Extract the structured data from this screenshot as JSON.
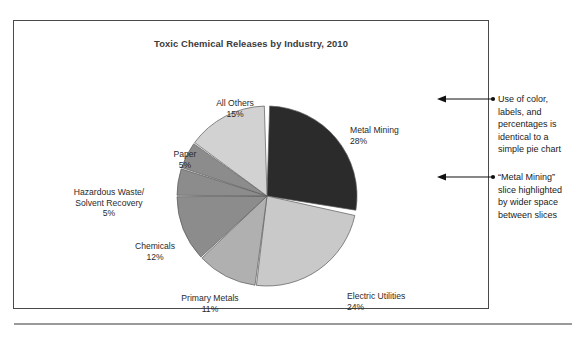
{
  "chart_data": {
    "type": "pie",
    "title": "Toxic Chemical Releases by Industry, 2010",
    "xlabel": "",
    "ylabel": "",
    "legend_position": "none",
    "grid": false,
    "categories": [
      "Metal Mining",
      "Electric Utilities",
      "Primary Metals",
      "Chemicals",
      "Hazardous Waste/ Solvent Recovery",
      "Paper",
      "All Others"
    ],
    "values": [
      28,
      24,
      11,
      12,
      5,
      5,
      15
    ],
    "slices": [
      {
        "name": "Metal Mining",
        "name_line1": "Metal Mining",
        "name_line2": "",
        "value": 28,
        "percent_label": "28%",
        "color": "#2b2b2b",
        "exploded": true
      },
      {
        "name": "Electric Utilities",
        "name_line1": "Electric Utilities",
        "name_line2": "",
        "value": 24,
        "percent_label": "24%",
        "color": "#c9c9c9",
        "exploded": false
      },
      {
        "name": "Primary Metals",
        "name_line1": "Primary Metals",
        "name_line2": "",
        "value": 11,
        "percent_label": "11%",
        "color": "#b0b0b0",
        "exploded": false
      },
      {
        "name": "Chemicals",
        "name_line1": "Chemicals",
        "name_line2": "",
        "value": 12,
        "percent_label": "12%",
        "color": "#8c8c8c",
        "exploded": false
      },
      {
        "name": "Hazardous Waste/ Solvent Recovery",
        "name_line1": "Hazardous Waste/",
        "name_line2": "Solvent Recovery",
        "value": 5,
        "percent_label": "5%",
        "color": "#8c8c8c",
        "exploded": false
      },
      {
        "name": "Paper",
        "name_line1": "Paper",
        "name_line2": "",
        "value": 5,
        "percent_label": "5%",
        "color": "#8c8c8c",
        "exploded": false
      },
      {
        "name": "All Others",
        "name_line1": "All Others",
        "name_line2": "",
        "value": 15,
        "percent_label": "15%",
        "color": "#d2d2d2",
        "exploded": false
      }
    ]
  },
  "annotations": [
    {
      "lines": [
        "Use of color,",
        "labels, and",
        "percentages is",
        "identical to a",
        "simple pie chart"
      ]
    },
    {
      "lines": [
        "“Metal Mining”",
        "slice highlighted",
        "by wider space",
        "between slices"
      ]
    }
  ]
}
